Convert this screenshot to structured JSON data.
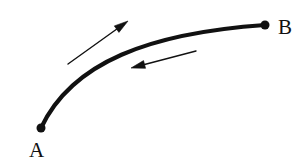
{
  "figure": {
    "type": "line-diagram",
    "background_color": "#ffffff",
    "stroke_color": "#111111"
  },
  "labels": {
    "start_point": "A",
    "end_point": "B"
  },
  "points": [
    {
      "name": "A",
      "label": "A",
      "x": 41,
      "y": 128,
      "radius": 4.5,
      "label_x": 29,
      "label_y": 157
    },
    {
      "name": "B",
      "label": "B",
      "x": 265,
      "y": 25,
      "radius": 4.5,
      "label_x": 278,
      "label_y": 34
    }
  ],
  "path": {
    "name": "curve-a-to-b",
    "start": {
      "x": 41,
      "y": 128
    },
    "end": {
      "x": 265,
      "y": 25
    },
    "control_1": {
      "x": 72,
      "y": 62
    },
    "control_2": {
      "x": 150,
      "y": 33
    },
    "stroke_width": 4.2,
    "stroke_color": "#111111"
  },
  "arrows": [
    {
      "name": "forward-arrow",
      "direction": "up-right",
      "tail": {
        "x": 68,
        "y": 64
      },
      "tip": {
        "x": 128,
        "y": 21
      },
      "stroke_width": 1.4,
      "head_length": 14,
      "head_width": 8,
      "stroke_color": "#111111"
    },
    {
      "name": "reverse-arrow",
      "direction": "left",
      "tail": {
        "x": 196,
        "y": 51
      },
      "tip": {
        "x": 131,
        "y": 68
      },
      "stroke_width": 1.4,
      "head_length": 14,
      "head_width": 8,
      "stroke_color": "#111111"
    }
  ],
  "chart_data": {
    "type": "line",
    "title": "",
    "xlabel": "",
    "ylabel": "",
    "grid": false,
    "legend": "none",
    "annotations": [
      "A",
      "B"
    ],
    "series": [
      {
        "name": "path A to B",
        "x": [
          41,
          50,
          60,
          70,
          85,
          100,
          120,
          145,
          170,
          200,
          230,
          265
        ],
        "y": [
          128,
          100,
          86,
          78,
          70,
          62,
          54,
          47,
          42,
          35,
          30,
          25
        ]
      }
    ]
  }
}
